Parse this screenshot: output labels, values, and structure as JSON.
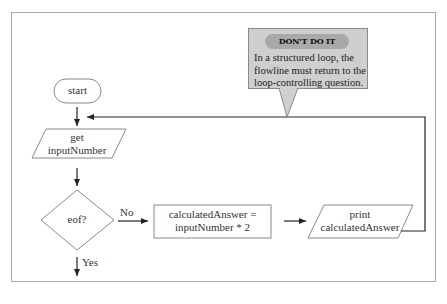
{
  "diagram": {
    "nodes": {
      "start": {
        "shape": "terminal",
        "label": "start"
      },
      "input": {
        "shape": "parallelogram",
        "label_line1": "get",
        "label_line2": "inputNumber"
      },
      "decision": {
        "shape": "diamond",
        "label": "eof?"
      },
      "process": {
        "shape": "rectangle",
        "label_line1": "calculatedAnswer =",
        "label_line2": "inputNumber * 2"
      },
      "output": {
        "shape": "parallelogram",
        "label_line1": "print",
        "label_line2": "calculatedAnswer"
      }
    },
    "edges": {
      "no_label": "No",
      "yes_label": "Yes"
    },
    "callout": {
      "title": "DON'T DO IT",
      "text": "In a structured loop, the flowline must return to the loop-controlling question."
    },
    "colors": {
      "line": "#222222",
      "shape_border": "#8a8a8a",
      "callout_bg": "#cfcfcf",
      "callout_title_bg": "#a9a9a9",
      "frame_border": "#a8a8a8"
    }
  }
}
